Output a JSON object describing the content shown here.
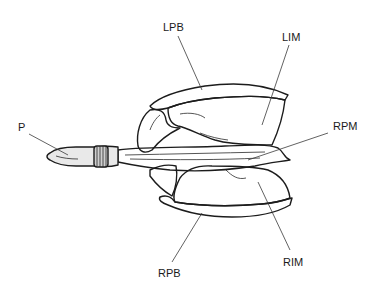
{
  "figure": {
    "type": "anatomical line drawing",
    "labels": [
      {
        "id": "P",
        "text": "P"
      },
      {
        "id": "LPB",
        "text": "LPB"
      },
      {
        "id": "LIM",
        "text": "LIM"
      },
      {
        "id": "RPM",
        "text": "RPM"
      },
      {
        "id": "RIM",
        "text": "RIM"
      },
      {
        "id": "RPB",
        "text": "RPB"
      }
    ]
  }
}
